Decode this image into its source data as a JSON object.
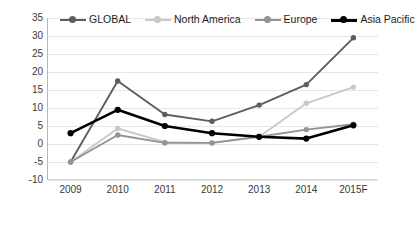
{
  "chart_data": {
    "type": "line",
    "title": "",
    "xlabel": "",
    "ylabel": "",
    "categories": [
      "2009",
      "2010",
      "2011",
      "2012",
      "2013",
      "2014",
      "2015F"
    ],
    "ylim": [
      -10,
      35
    ],
    "yticks": [
      35,
      30,
      25,
      20,
      15,
      10,
      5,
      0,
      -5,
      -10
    ],
    "grid": true,
    "legend_position": "top",
    "series": [
      {
        "name": "GLOBAL",
        "color": "#5e5e5e",
        "values": [
          -5.0,
          17.5,
          8.2,
          6.3,
          10.8,
          16.5,
          29.5
        ]
      },
      {
        "name": "North America",
        "color": "#c9c9c9",
        "values": [
          -5.0,
          4.3,
          0.5,
          0.3,
          2.0,
          11.3,
          15.8
        ]
      },
      {
        "name": "Europe",
        "color": "#949494",
        "values": [
          -5.0,
          2.5,
          0.3,
          0.3,
          2.0,
          4.0,
          5.5
        ]
      },
      {
        "name": "Asia Pacific",
        "color": "#000000",
        "values": [
          3.0,
          9.5,
          5.0,
          3.0,
          2.0,
          1.5,
          5.2
        ]
      }
    ]
  },
  "axis": {
    "y_tick_labels": [
      "35",
      "30",
      "25",
      "20",
      "15",
      "10",
      "5",
      "0",
      "-5",
      "-10"
    ],
    "x_tick_labels": [
      "2009",
      "2010",
      "2011",
      "2012",
      "2013",
      "2014",
      "2015F"
    ]
  },
  "legend": {
    "items": [
      {
        "label": "GLOBAL"
      },
      {
        "label": "North America"
      },
      {
        "label": "Europe"
      },
      {
        "label": "Asia Pacific"
      }
    ]
  }
}
